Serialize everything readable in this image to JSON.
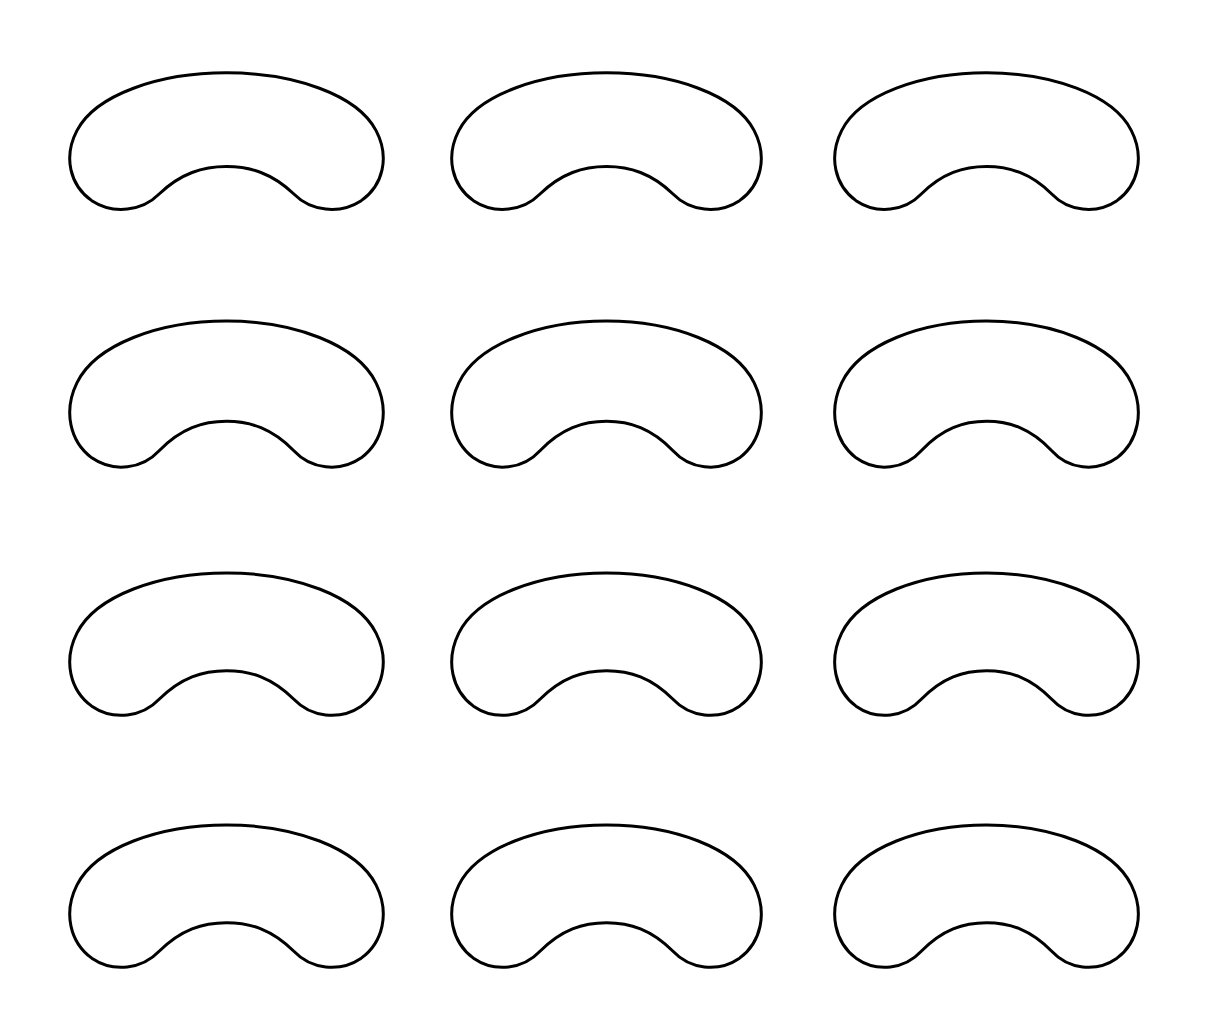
{
  "page": {
    "kind": "printable-template-sheet",
    "background_color": "#ffffff",
    "width": 1208,
    "height": 1034
  },
  "style": {
    "stroke_color": "#000000",
    "fill_color": "none",
    "stroke_width": 3
  },
  "grid": {
    "columns": 3,
    "rows": 4,
    "total_shapes": 12,
    "column_left_edges": [
      68,
      450,
      833
    ],
    "column_right_edges": [
      385,
      763,
      1140
    ],
    "row_top_edges": [
      70,
      318,
      570,
      822
    ],
    "row_bottom_edges": [
      212,
      470,
      718,
      970
    ]
  },
  "shape": {
    "name": "bean-outline",
    "description": "kidney bean / cashew outline with central bottom notch",
    "viewbox": "0 0 320 150",
    "path": "M 160 3 C 228 3 292 26 311 64 C 325 92 318 122 296 138 C 274 153 245 149 228 131 C 206 109 184 102 160 102 C 136 102 114 109 92 131 C 75 149 46 153 24 138 C 2 122 -5 92 9 64 C 28 26 92 3 160 3 Z",
    "notch_peak": {
      "x": 160,
      "y": 102
    }
  },
  "shapes": [
    {
      "id": "bean-1",
      "row": 1,
      "column": 1,
      "x": 68,
      "y": 70,
      "width": 317,
      "height": 142
    },
    {
      "id": "bean-2",
      "row": 1,
      "column": 2,
      "x": 450,
      "y": 70,
      "width": 313,
      "height": 142
    },
    {
      "id": "bean-3",
      "row": 1,
      "column": 3,
      "x": 833,
      "y": 70,
      "width": 307,
      "height": 142
    },
    {
      "id": "bean-4",
      "row": 2,
      "column": 1,
      "x": 68,
      "y": 318,
      "width": 317,
      "height": 152
    },
    {
      "id": "bean-5",
      "row": 2,
      "column": 2,
      "x": 450,
      "y": 318,
      "width": 313,
      "height": 152
    },
    {
      "id": "bean-6",
      "row": 2,
      "column": 3,
      "x": 833,
      "y": 318,
      "width": 307,
      "height": 152
    },
    {
      "id": "bean-7",
      "row": 3,
      "column": 1,
      "x": 68,
      "y": 570,
      "width": 317,
      "height": 148
    },
    {
      "id": "bean-8",
      "row": 3,
      "column": 2,
      "x": 450,
      "y": 570,
      "width": 313,
      "height": 148
    },
    {
      "id": "bean-9",
      "row": 3,
      "column": 3,
      "x": 833,
      "y": 570,
      "width": 307,
      "height": 148
    },
    {
      "id": "bean-10",
      "row": 4,
      "column": 1,
      "x": 68,
      "y": 822,
      "width": 317,
      "height": 148
    },
    {
      "id": "bean-11",
      "row": 4,
      "column": 2,
      "x": 450,
      "y": 822,
      "width": 313,
      "height": 148
    },
    {
      "id": "bean-12",
      "row": 4,
      "column": 3,
      "x": 833,
      "y": 822,
      "width": 307,
      "height": 148
    }
  ]
}
